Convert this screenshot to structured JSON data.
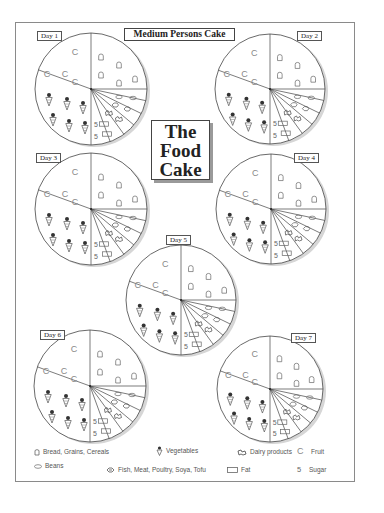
{
  "header": {
    "title": "Medium Persons Cake",
    "center_title": [
      "The",
      "Food",
      "Cake"
    ]
  },
  "days": [
    {
      "label": "Day 1"
    },
    {
      "label": "Day 2"
    },
    {
      "label": "Day 3"
    },
    {
      "label": "Day 4"
    },
    {
      "label": "Day 5"
    },
    {
      "label": "Day 6"
    },
    {
      "label": "Day 7"
    }
  ],
  "pie_segments": [
    {
      "group": "Fruit",
      "symbol": "C",
      "count": 5
    },
    {
      "group": "Bread, Grains, Cereals",
      "symbol": "bread-icon",
      "count": 6
    },
    {
      "group": "Beans",
      "symbol": "bean-icon",
      "count": 2
    },
    {
      "group": "Fish, Meat, Poultry, Soya, Tofu",
      "symbol": "fish-icon",
      "count": 2
    },
    {
      "group": "Dairy products",
      "symbol": "dairy-icon",
      "count": 2
    },
    {
      "group": "Fat",
      "symbol": "fat-icon",
      "count": 2
    },
    {
      "group": "Sugar",
      "symbol": "5",
      "count": 2
    },
    {
      "group": "Vegetables",
      "symbol": "vegetable-icon",
      "count": 6
    }
  ],
  "legend": {
    "bread": "Bread, Grains, Cereals",
    "vegetables": "Vegetables",
    "dairy": "Dairy products",
    "fruit_symbol": "C",
    "fruit": "Fruit",
    "beans": "Beans",
    "fish": "Fish, Meat, Poultry, Soya, Tofu",
    "fat": "Fat",
    "sugar_symbol": "5",
    "sugar": "Sugar"
  }
}
